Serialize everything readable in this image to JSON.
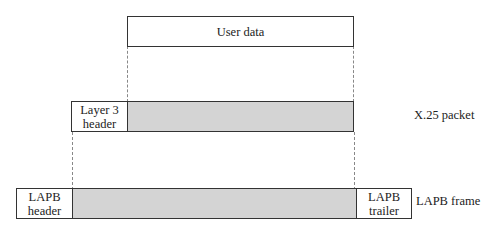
{
  "diagram": {
    "user_data": {
      "label": "User data"
    },
    "x25_packet": {
      "header": "Layer 3\nheader",
      "header_line1": "Layer 3",
      "header_line2": "header",
      "label": "X.25 packet"
    },
    "lapb_frame": {
      "header_line1": "LAPB",
      "header_line2": "header",
      "trailer_line1": "LAPB",
      "trailer_line2": "trailer",
      "label": "LAPB frame"
    },
    "colors": {
      "shaded": "#d4d4d4",
      "border": "#333333",
      "dashed": "#888888"
    }
  }
}
